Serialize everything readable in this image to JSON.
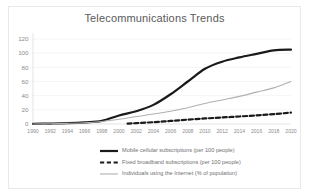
{
  "chart_data": {
    "type": "line",
    "title": "Telecommunications Trends",
    "xlabel": "",
    "ylabel": "",
    "x": [
      1990,
      1992,
      1994,
      1996,
      1998,
      2000,
      2002,
      2004,
      2006,
      2008,
      2010,
      2012,
      2014,
      2016,
      2018,
      2020
    ],
    "xtick_labels": [
      "1990",
      "1992",
      "1994",
      "1996",
      "1998",
      "2000",
      "2002",
      "2004",
      "2006",
      "2008",
      "2010",
      "2012",
      "2014",
      "2016",
      "2018",
      "2020"
    ],
    "ytick_labels": [
      "0",
      "20",
      "40",
      "60",
      "80",
      "100",
      "120"
    ],
    "ytick_values": [
      0,
      20,
      40,
      60,
      80,
      100,
      120
    ],
    "ylim": [
      0,
      120
    ],
    "xlim": [
      1990,
      2020
    ],
    "grid": true,
    "legend_position": "bottom",
    "series": [
      {
        "name": "Mobile cellular subscriptions (per 100 people)",
        "style": "solid",
        "color": "#1a1a1a",
        "width": 2.2,
        "x": [
          1990,
          1992,
          1994,
          1996,
          1998,
          2000,
          2002,
          2004,
          2006,
          2008,
          2010,
          2012,
          2014,
          2016,
          2018,
          2020
        ],
        "values": [
          0.2,
          0.6,
          1.2,
          2.4,
          4.5,
          12,
          18,
          27,
          42,
          60,
          78,
          88,
          94,
          99,
          104,
          105
        ]
      },
      {
        "name": "Fixed broadband subscriptions (per 100 people)",
        "style": "dashed",
        "color": "#1a1a1a",
        "width": 2.2,
        "x": [
          2001,
          2002,
          2004,
          2006,
          2008,
          2010,
          2012,
          2014,
          2016,
          2018,
          2020
        ],
        "values": [
          0.5,
          1.2,
          2.6,
          4.3,
          6.2,
          7.8,
          9.2,
          10.6,
          12.2,
          14.0,
          16.0
        ]
      },
      {
        "name": "Individuals using the Internet (% of population)",
        "style": "solid",
        "color": "#b0b0b0",
        "width": 1.1,
        "x": [
          1990,
          1992,
          1994,
          1996,
          1998,
          2000,
          2002,
          2004,
          2006,
          2008,
          2010,
          2012,
          2014,
          2016,
          2018,
          2020
        ],
        "values": [
          0.05,
          0.3,
          0.9,
          1.8,
          3.6,
          6.7,
          10.5,
          14.0,
          18.0,
          23.0,
          29.0,
          34.0,
          39.0,
          45.0,
          51.0,
          60.0
        ]
      }
    ],
    "legend": [
      {
        "label": "Mobile cellular subscriptions (per 100 people)",
        "style": "solid",
        "color": "#1a1a1a",
        "width": 2.2
      },
      {
        "label": "Fixed broadband subscriptions (per 100 people)",
        "style": "dashed",
        "color": "#1a1a1a",
        "width": 2.2
      },
      {
        "label": "Individuals using the Internet (% of population)",
        "style": "solid",
        "color": "#b0b0b0",
        "width": 1.1
      }
    ]
  },
  "colors": {
    "background": "#ffffff",
    "frame": "#e9e9e9",
    "grid": "#f0f0f0",
    "axis": "#d8d8d8",
    "title_text": "#5a5a5a",
    "tick_text": "#8c8c8c",
    "legend_text": "#6f6f6f"
  }
}
